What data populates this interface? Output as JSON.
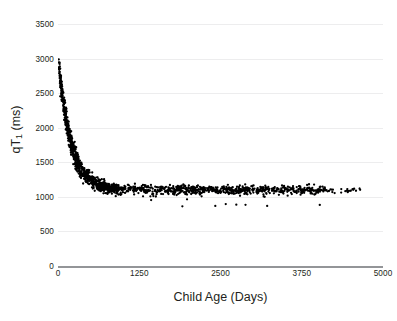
{
  "chart_data": {
    "type": "scatter",
    "title": "",
    "xlabel": "Child Age (Days)",
    "ylabel_html": "qT1 (ms)",
    "ylabel_main": "qT",
    "ylabel_sub": "1",
    "ylabel_unit": " (ms)",
    "xlim": [
      0,
      5000
    ],
    "ylim": [
      0,
      3500
    ],
    "xticks": [
      0,
      1250,
      2500,
      3750,
      5000
    ],
    "yticks": [
      0,
      500,
      1000,
      1500,
      2000,
      2500,
      3000,
      3500
    ],
    "xtick_labels": [
      "0",
      "1250",
      "2500",
      "3750",
      "5000"
    ],
    "ytick_labels": [
      "0",
      "500",
      "1000",
      "1500",
      "2000",
      "2500",
      "3000",
      "3500"
    ],
    "grid": "horizontal",
    "legend": "none",
    "marker_color": "#000000",
    "marker_size": 2,
    "gridline_color": "#ededee",
    "axis_color": "#939598",
    "fit": {
      "model": "exponential_decay_plus_offset",
      "asymptote": 1100,
      "amplitude": 1950,
      "decay_constant_days": 190
    },
    "point_count": 1600,
    "x_data_range": [
      10,
      4650
    ],
    "y_data_range": [
      880,
      3060
    ],
    "series": [
      {
        "name": "qT1 measurements",
        "points_summary": [
          {
            "x": 20,
            "y_mean": 2870,
            "y_spread": 180
          },
          {
            "x": 60,
            "y_mean": 2560,
            "y_spread": 200
          },
          {
            "x": 100,
            "y_mean": 2300,
            "y_spread": 200
          },
          {
            "x": 150,
            "y_mean": 2020,
            "y_spread": 190
          },
          {
            "x": 200,
            "y_mean": 1800,
            "y_spread": 170
          },
          {
            "x": 300,
            "y_mean": 1530,
            "y_spread": 150
          },
          {
            "x": 400,
            "y_mean": 1390,
            "y_spread": 130
          },
          {
            "x": 600,
            "y_mean": 1270,
            "y_spread": 110
          },
          {
            "x": 900,
            "y_mean": 1200,
            "y_spread": 100
          },
          {
            "x": 1250,
            "y_mean": 1165,
            "y_spread": 95
          },
          {
            "x": 1750,
            "y_mean": 1145,
            "y_spread": 95
          },
          {
            "x": 2500,
            "y_mean": 1130,
            "y_spread": 90
          },
          {
            "x": 3250,
            "y_mean": 1115,
            "y_spread": 90
          },
          {
            "x": 4000,
            "y_mean": 1090,
            "y_spread": 85
          },
          {
            "x": 4600,
            "y_mean": 1020,
            "y_spread": 60
          }
        ]
      }
    ]
  }
}
